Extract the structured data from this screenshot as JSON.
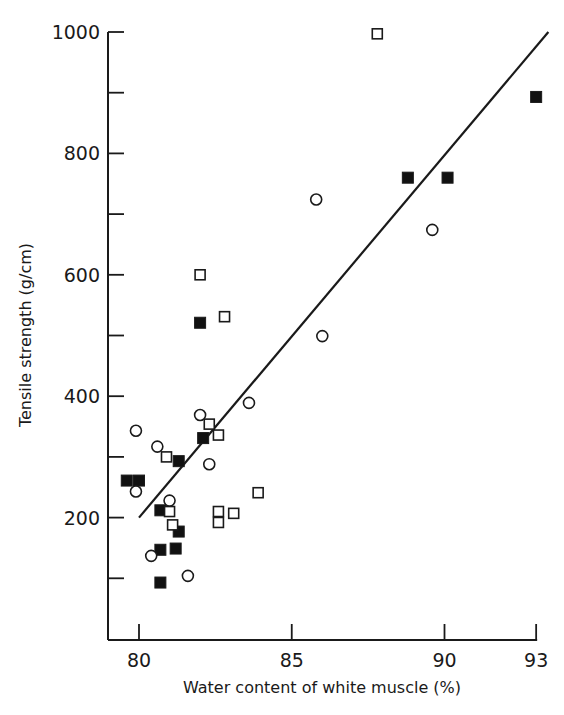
{
  "chart_data": {
    "type": "scatter",
    "title": "",
    "xlabel": "Water content of white muscle (%)",
    "ylabel": "Tensile strength (g/cm)",
    "xlim": [
      79,
      93
    ],
    "ylim": [
      0,
      1000
    ],
    "x_ticks": [
      {
        "value": 80,
        "label": "80"
      },
      {
        "value": 85,
        "label": "85"
      },
      {
        "value": 90,
        "label": "90"
      },
      {
        "value": 93,
        "label": "93"
      }
    ],
    "y_ticks": [
      {
        "value": 100,
        "label": ""
      },
      {
        "value": 200,
        "label": "200"
      },
      {
        "value": 300,
        "label": ""
      },
      {
        "value": 400,
        "label": "400"
      },
      {
        "value": 500,
        "label": ""
      },
      {
        "value": 600,
        "label": "600"
      },
      {
        "value": 700,
        "label": ""
      },
      {
        "value": 800,
        "label": "800"
      },
      {
        "value": 900,
        "label": ""
      },
      {
        "value": 1000,
        "label": "1000"
      }
    ],
    "grid": false,
    "legend": null,
    "series": [
      {
        "name": "filled squares",
        "marker": "filled-square",
        "points": [
          [
            79.6,
            261
          ],
          [
            80.0,
            261
          ],
          [
            80.7,
            212
          ],
          [
            81.3,
            293
          ],
          [
            82.1,
            331
          ],
          [
            81.3,
            177
          ],
          [
            80.7,
            147
          ],
          [
            81.2,
            149
          ],
          [
            80.7,
            93
          ],
          [
            82.0,
            521
          ],
          [
            88.8,
            760
          ],
          [
            90.1,
            760
          ],
          [
            93.0,
            893
          ]
        ]
      },
      {
        "name": "open squares",
        "marker": "open-square",
        "points": [
          [
            80.9,
            300
          ],
          [
            82.3,
            354
          ],
          [
            82.6,
            336
          ],
          [
            81.0,
            210
          ],
          [
            81.1,
            188
          ],
          [
            82.6,
            210
          ],
          [
            82.6,
            192
          ],
          [
            83.1,
            207
          ],
          [
            83.9,
            241
          ],
          [
            82.0,
            600
          ],
          [
            82.8,
            531
          ],
          [
            87.8,
            997
          ]
        ]
      },
      {
        "name": "open circles",
        "marker": "open-circle",
        "points": [
          [
            79.9,
            343
          ],
          [
            80.6,
            317
          ],
          [
            82.0,
            369
          ],
          [
            82.3,
            288
          ],
          [
            83.6,
            389
          ],
          [
            79.9,
            243
          ],
          [
            81.0,
            228
          ],
          [
            80.4,
            137
          ],
          [
            81.6,
            104
          ],
          [
            86.0,
            499
          ],
          [
            85.8,
            724
          ],
          [
            89.6,
            674
          ]
        ]
      }
    ],
    "regression_line": {
      "from": [
        80.0,
        200
      ],
      "to": [
        93.4,
        1000
      ]
    }
  }
}
